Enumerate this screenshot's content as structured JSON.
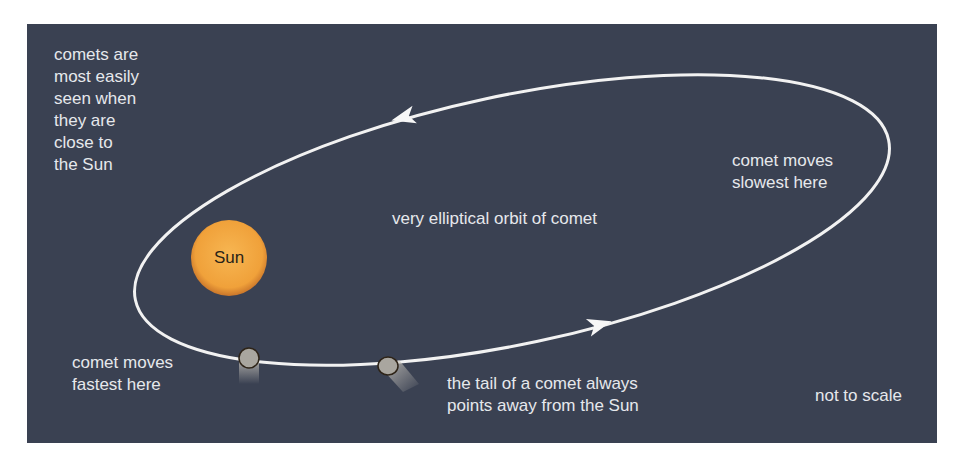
{
  "diagram": {
    "title": "very elliptical orbit of comet",
    "labels": {
      "visibility_note": "comets are\nmost easily\nseen when\nthey are\nclose to\nthe Sun",
      "slowest": "comet moves\nslowest here",
      "fastest": "comet moves\nfastest here",
      "tail_note": "the tail of a comet always\npoints away from the Sun",
      "scale_note": "not to scale",
      "sun": "Sun"
    },
    "colors": {
      "background": "#3a4152",
      "orbit": "#f2f2f2",
      "sun": "#f0a640",
      "text": "#e6e8ec"
    },
    "elements": {
      "sun": {
        "cx": 202,
        "cy": 234,
        "r": 38
      },
      "orbit": {
        "cx": 485,
        "cy": 196,
        "rx": 385,
        "ry": 124,
        "rotation_deg": -12
      },
      "arrows": [
        {
          "x": 378,
          "y": 93,
          "direction": "left"
        },
        {
          "x": 571,
          "y": 301,
          "direction": "right"
        }
      ],
      "comets": [
        {
          "x": 222,
          "y": 334
        },
        {
          "x": 361,
          "y": 342
        }
      ]
    }
  }
}
